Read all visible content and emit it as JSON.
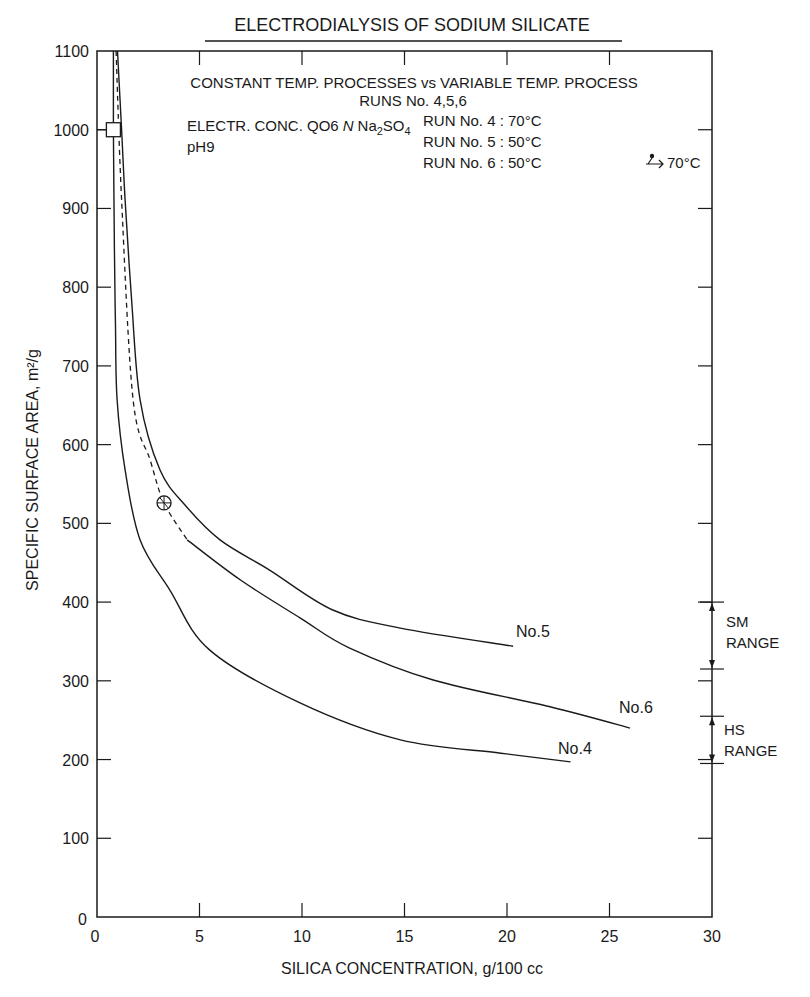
{
  "chart_data": {
    "type": "line",
    "title": "ELECTRODIALYSIS OF SODIUM SILICATE",
    "xlabel": "SILICA CONCENTRATION, g/100 cc",
    "ylabel": "SPECIFIC SURFACE AREA, m²/g",
    "xlim": [
      0,
      30
    ],
    "ylim": [
      0,
      1100
    ],
    "xticks": [
      0,
      5,
      10,
      15,
      20,
      25,
      30
    ],
    "yticks": [
      0,
      100,
      200,
      300,
      400,
      500,
      600,
      700,
      800,
      900,
      1000,
      1100
    ],
    "grid": false,
    "annotations": {
      "heading": "CONSTANT TEMP. PROCESSES vs VARIABLE TEMP. PROCESS",
      "runs": "RUNS No. 4,5,6",
      "electrolyte": "ELECTR. CONC. QO6 N Na₂SO₄",
      "electrolyte_parts": {
        "prefix": "ELECTR. CONC. QO6",
        "italic": "N",
        "salt_a": "Na",
        "sub_a": "2",
        "salt_b": "SO",
        "sub_b": "4"
      },
      "ph": "pH9",
      "legend": [
        "RUN No. 4 : 70°C",
        "RUN No. 5 : 50°C",
        "RUN No. 6 : 50°C → 70°C"
      ],
      "legend_run6_prefix": "RUN No. 6 : 50°C",
      "legend_run6_suffix": "70°C",
      "sm_range": {
        "label_1": "SM",
        "label_2": "RANGE",
        "from": 315,
        "to": 400
      },
      "hs_range": {
        "label_1": "HS",
        "label_2": "RANGE",
        "from": 195,
        "to": 255
      }
    },
    "series": [
      {
        "name": "No.4",
        "label": "No.4",
        "temperature": "70°C",
        "style": "solid",
        "x": [
          0.8,
          0.8,
          0.85,
          0.9,
          0.98,
          1.37,
          2.1,
          3.56,
          5.5,
          9.9,
          14.8,
          19.7,
          23.1
        ],
        "y": [
          1100,
          1000,
          850,
          750,
          657,
          568,
          479,
          415,
          339,
          272,
          225,
          208,
          197
        ]
      },
      {
        "name": "No.5",
        "label": "No.5",
        "temperature": "50°C",
        "style": "solid",
        "x": [
          1.0,
          1.2,
          1.37,
          1.7,
          2.1,
          3.07,
          4.3,
          6.0,
          8.4,
          11.5,
          14.8,
          20.3
        ],
        "y": [
          1100,
          1000,
          911,
          780,
          657,
          568,
          523,
          479,
          441,
          390,
          367,
          344
        ]
      },
      {
        "name": "No.6",
        "label": "No.6",
        "temperature": "50°C → 70°C",
        "style": "dashed-then-solid",
        "dashed_x": [
          0.93,
          1.2,
          1.76,
          2.6,
          3.27,
          4.4
        ],
        "dashed_y": [
          1100,
          911,
          657,
          580,
          526,
          479
        ],
        "x": [
          4.4,
          7.0,
          9.9,
          12.3,
          16.4,
          22.1,
          26.0
        ],
        "y": [
          479,
          428,
          380,
          342,
          301,
          267,
          240
        ]
      }
    ],
    "markers": [
      {
        "shape": "square",
        "x": 0.8,
        "y": 1000
      },
      {
        "shape": "circle-cross",
        "x": 3.27,
        "y": 526
      }
    ]
  }
}
